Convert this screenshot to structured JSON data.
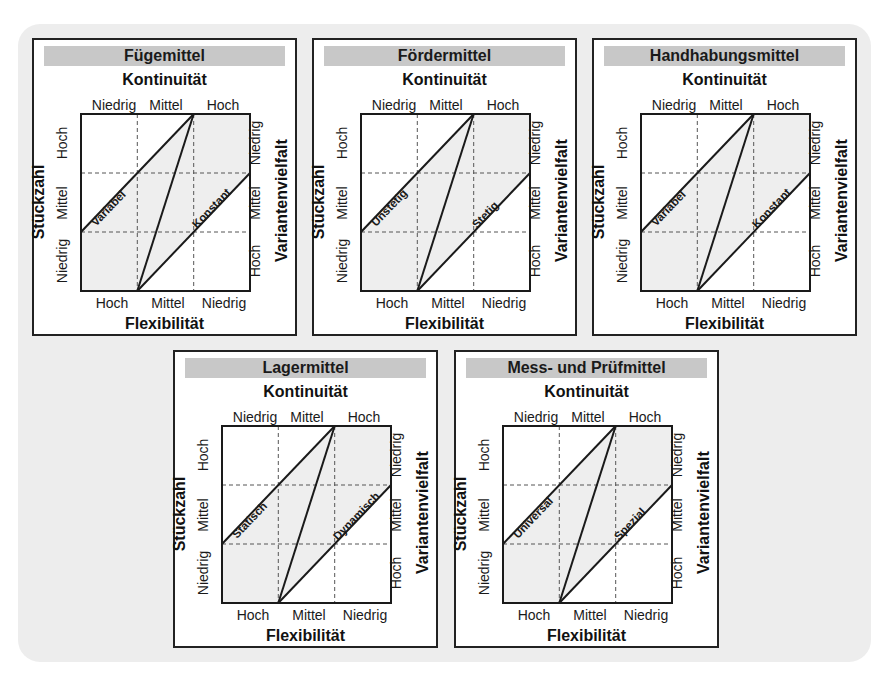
{
  "colors": {
    "background": "#ffffff",
    "outer_panel": "#ededed",
    "title_bar": "#c8c8c8",
    "plot_shade": "#eeeeee",
    "line": "#1a1a1a"
  },
  "common": {
    "axis_top": "Kontinuität",
    "axis_bottom": "Flexibilität",
    "axis_left": "Stückzahl",
    "axis_right": "Variantenvielfalt",
    "top_ticks": [
      "Niedrig",
      "Mittel",
      "Hoch"
    ],
    "bottom_ticks": [
      "Hoch",
      "Mittel",
      "Niedrig"
    ],
    "left_ticks": [
      "Hoch",
      "Mittel",
      "Niedrig"
    ],
    "right_ticks": [
      "Niedrig",
      "Mittel",
      "Hoch"
    ]
  },
  "panels": [
    {
      "title": "Fügemittel",
      "label_left_line": "Variabel",
      "label_right_line": "Konstant"
    },
    {
      "title": "Fördermittel",
      "label_left_line": "Unstetig",
      "label_right_line": "Stetig"
    },
    {
      "title": "Handhabungsmittel",
      "label_left_line": "Variabel",
      "label_right_line": "Konstant"
    },
    {
      "title": "Lagermittel",
      "label_left_line": "Statisch",
      "label_right_line": "Dynamisch"
    },
    {
      "title": "Mess- und Prüfmittel",
      "label_left_line": "Universal",
      "label_right_line": "Spezial"
    }
  ]
}
